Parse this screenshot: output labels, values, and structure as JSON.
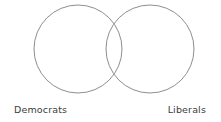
{
  "figure": {
    "type": "venn-diagram",
    "background_color": "#ffffff",
    "stroke_color": "#808080",
    "stroke_width": 0.9,
    "fill": "none"
  },
  "sets": [
    {
      "id": "left",
      "label": "Democrats",
      "center_x": 78,
      "center_y": 49,
      "radius": 44
    },
    {
      "id": "right",
      "label": "Liberals",
      "center_x": 150,
      "center_y": 49,
      "radius": 44
    }
  ],
  "labels": {
    "left_text": "Democrats",
    "right_text": "Liberals",
    "text_color": "#3c3c3c"
  },
  "intersection": {
    "top_point_x": 114,
    "top_point_y": 8,
    "bottom_point_x": 114,
    "bottom_point_y": 89
  }
}
